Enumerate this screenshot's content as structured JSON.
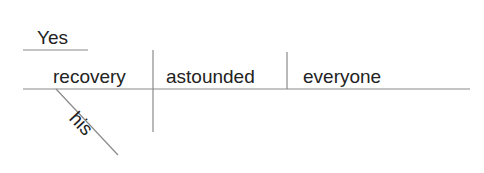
{
  "diagram": {
    "type": "sentence-diagram",
    "sentence": "Yes, his recovery astounded everyone",
    "interjection": "Yes",
    "subject": "recovery",
    "verb": "astounded",
    "direct_object": "everyone",
    "modifier": "his",
    "line_color": "#8a8a8a",
    "text_color": "#222222"
  }
}
